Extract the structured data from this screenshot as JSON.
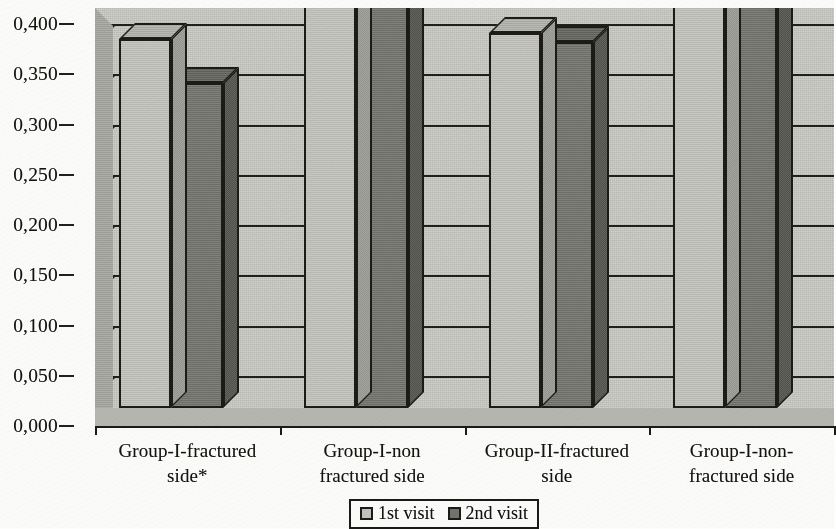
{
  "chart_data": {
    "type": "bar",
    "title": "",
    "xlabel": "",
    "ylabel": "",
    "ylim": [
      0.0,
      0.4
    ],
    "ytick_labels": [
      "0,400",
      "0,350",
      "0,300",
      "0,250",
      "0,200",
      "0,150",
      "0,100",
      "0,050",
      "0,000"
    ],
    "ytick_values": [
      0.4,
      0.35,
      0.3,
      0.25,
      0.2,
      0.15,
      0.1,
      0.05,
      0.0
    ],
    "grid": true,
    "legend_position": "bottom-center",
    "style": "3d-grouped-bar-grayscale",
    "categories": [
      "Group-I-fractured side*",
      "Group-I-non fractured side",
      "Group-II-fractured side",
      "Group-I-non-fractured side"
    ],
    "category_lines": [
      [
        "Group-I-fractured",
        "side*"
      ],
      [
        "Group-I-non",
        "fractured side"
      ],
      [
        "Group-II-fractured",
        "side"
      ],
      [
        "Group-I-non-",
        "fractured side"
      ]
    ],
    "series": [
      {
        "name": "1st visit",
        "color": "#c4c4bf",
        "values": [
          0.367,
          0.4,
          0.373,
          0.4
        ]
      },
      {
        "name": "2nd visit",
        "color": "#74746f",
        "values": [
          0.323,
          0.4,
          0.364,
          0.4
        ]
      }
    ]
  },
  "legend": {
    "items": [
      {
        "label": "1st visit",
        "swatch": "light-gray-square"
      },
      {
        "label": "2nd visit",
        "swatch": "dark-gray-square"
      }
    ]
  },
  "colors": {
    "series_1": "#c4c4bf",
    "series_2": "#74746f",
    "plot_background": "#c9c9c4",
    "axis": "#1c1a17",
    "page_background": "#fdfdfb"
  }
}
